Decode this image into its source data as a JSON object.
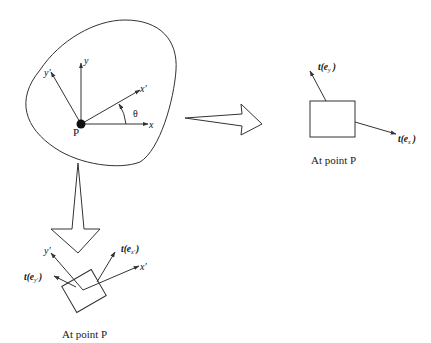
{
  "diagram": {
    "body": {
      "point_label": "P",
      "axes": {
        "x": "x",
        "y": "y",
        "x_prime": "x′",
        "y_prime": "y′",
        "angle": "θ"
      }
    },
    "right_panel": {
      "caption": "At point P",
      "traction_x": {
        "t": "t(",
        "e": "e",
        "sub": "x",
        "close": ")"
      },
      "traction_y": {
        "t": "t(",
        "e": "e",
        "sub": "y",
        "close": ")"
      }
    },
    "bottom_panel": {
      "caption": "At point P",
      "axis_x_prime": "x′",
      "axis_y_prime": "y′",
      "traction_x_prime": {
        "t": "t(",
        "e": "e",
        "sub": "x′",
        "close": ")"
      },
      "traction_y_prime": {
        "t": "t(",
        "e": "e",
        "sub": "y′",
        "close": ")"
      }
    },
    "colors": {
      "line": "#333333",
      "background": "#ffffff"
    }
  }
}
